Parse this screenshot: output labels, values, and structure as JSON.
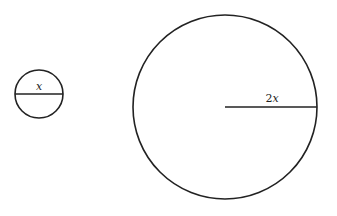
{
  "diagram": {
    "small_circle": {
      "center": [
        39,
        94
      ],
      "radius": 24,
      "segment": "diameter",
      "label_var": "x"
    },
    "large_circle": {
      "center": [
        225,
        107
      ],
      "radius": 92,
      "segment": "radius",
      "label_coef": "2",
      "label_var": "x"
    },
    "stroke_color": "#222222",
    "background": "#ffffff"
  }
}
